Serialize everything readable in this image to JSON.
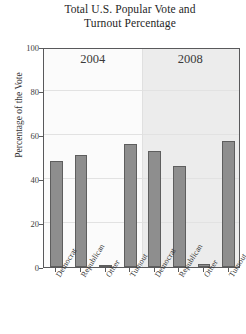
{
  "chart_data": {
    "type": "bar",
    "title": "Total U.S. Popular Vote and Turnout Percentage",
    "title_lines": [
      "Total U.S. Popular Vote and",
      "Turnout Percentage"
    ],
    "xlabel": "",
    "ylabel": "Percentage of the Vote",
    "ylim": [
      0,
      100
    ],
    "yticks": [
      0,
      20,
      40,
      60,
      80,
      100
    ],
    "ytick_labels": [
      "0",
      "20",
      "40",
      "60",
      "80",
      "100"
    ],
    "grid": true,
    "legend": "none",
    "panels": [
      {
        "label": "2004",
        "categories": [
          "Democrat",
          "Republican",
          "Other",
          "Turnout"
        ],
        "values": [
          48.3,
          50.7,
          1.0,
          55.7
        ]
      },
      {
        "label": "2008",
        "categories": [
          "Democrat",
          "Republican",
          "Other",
          "Turnout"
        ],
        "values": [
          52.9,
          45.7,
          1.4,
          57.4
        ]
      }
    ],
    "colors": {
      "bar_fill": "#8e8e8e",
      "bar_edge": "#5e5e5e",
      "panel_2004_bg": "#fbfbfb",
      "panel_2008_bg": "#ececec",
      "axis": "#59595b",
      "grid": "#e2e2e2",
      "text": "#2b2b2b"
    }
  }
}
